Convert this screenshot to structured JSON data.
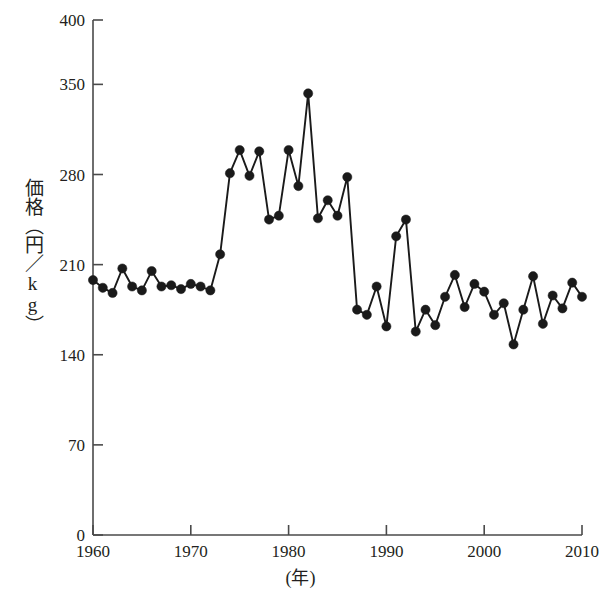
{
  "chart_data": {
    "type": "line",
    "title": "",
    "subtitle": "",
    "xlabel": "(年)",
    "ylabel": "価格（円／kg）",
    "xlim": [
      1960,
      2010
    ],
    "ylim": [
      0,
      400
    ],
    "grid": false,
    "legend": null,
    "marker": "filled-circle",
    "line_color": "#1a1a1a",
    "marker_color": "#1a1a1a",
    "x_ticks": [
      1960,
      1970,
      1980,
      1990,
      2000,
      2010
    ],
    "x_tick_labels": [
      "1960",
      "1970",
      "1980",
      "1990",
      "2000",
      "2010"
    ],
    "y_ticks": [
      0,
      70,
      140,
      210,
      280,
      350,
      400
    ],
    "y_tick_labels": [
      "0",
      "70",
      "140",
      "210",
      "280",
      "350",
      "400"
    ],
    "series": [
      {
        "name": "価格",
        "x": [
          1960,
          1961,
          1962,
          1963,
          1964,
          1965,
          1966,
          1967,
          1968,
          1969,
          1970,
          1971,
          1972,
          1973,
          1974,
          1975,
          1976,
          1977,
          1978,
          1979,
          1980,
          1981,
          1982,
          1983,
          1984,
          1985,
          1986,
          1987,
          1988,
          1989,
          1990,
          1991,
          1992,
          1993,
          1994,
          1995,
          1996,
          1997,
          1998,
          1999,
          2000,
          2001,
          2002,
          2003,
          2004,
          2005,
          2006,
          2007,
          2008,
          2009,
          2010
        ],
        "values": [
          198,
          192,
          188,
          207,
          193,
          190,
          205,
          193,
          194,
          191,
          195,
          193,
          190,
          218,
          281,
          299,
          279,
          298,
          245,
          248,
          299,
          271,
          343,
          246,
          260,
          248,
          278,
          175,
          171,
          193,
          162,
          232,
          245,
          158,
          175,
          163,
          185,
          202,
          177,
          195,
          189,
          171,
          180,
          148,
          175,
          201,
          164,
          186,
          176,
          196,
          185
        ]
      }
    ]
  },
  "axes": {
    "y_axis_caption": "価格（円／kg）",
    "x_axis_caption": "(年)"
  }
}
